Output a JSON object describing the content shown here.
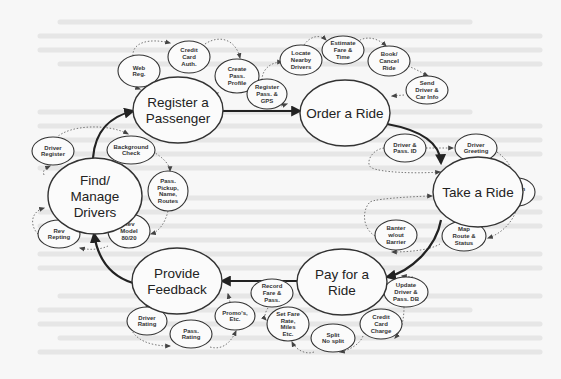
{
  "diagram": {
    "type": "cycle",
    "main_nodes": [
      {
        "id": "register",
        "label": [
          "Register a",
          "Passenger"
        ]
      },
      {
        "id": "order",
        "label": [
          "Order a Ride"
        ]
      },
      {
        "id": "take",
        "label": [
          "Take a Ride"
        ]
      },
      {
        "id": "pay",
        "label": [
          "Pay for a",
          "Ride"
        ]
      },
      {
        "id": "feedback",
        "label": [
          "Provide",
          "Feedback"
        ]
      },
      {
        "id": "drivers",
        "label": [
          "Find/",
          "Manage",
          "Drivers"
        ]
      }
    ],
    "main_flow": [
      "register",
      "order",
      "take",
      "pay",
      "feedback",
      "drivers",
      "register"
    ],
    "sub_nodes": {
      "register": [
        {
          "label": [
            "Web",
            "Reg."
          ]
        },
        {
          "label": [
            "Credit",
            "Card",
            "Auth."
          ]
        },
        {
          "label": [
            "Create",
            "Pass.",
            "Profile"
          ]
        }
      ],
      "order": [
        {
          "label": [
            "Register",
            "Pass. &",
            "GPS"
          ]
        },
        {
          "label": [
            "Locate",
            "Nearby",
            "Drivers"
          ]
        },
        {
          "label": [
            "Estimate",
            "Fare &",
            "Time"
          ]
        },
        {
          "label": [
            "Book/",
            "Cancel",
            "Ride"
          ]
        },
        {
          "label": [
            "Send",
            "Driver &",
            "Car Info"
          ]
        }
      ],
      "take": [
        {
          "label": [
            "Driver &",
            "Pass. ID"
          ]
        },
        {
          "label": [
            "Driver",
            "Greeting"
          ]
        },
        {
          "label": [
            "Clean",
            "Car"
          ]
        },
        {
          "label": [
            "Map",
            "Route &",
            "Status"
          ]
        },
        {
          "label": [
            "Banter",
            "w/out",
            "Barrier"
          ]
        }
      ],
      "pay": [
        {
          "label": [
            "Update",
            "Driver &",
            "Pass. DB"
          ]
        },
        {
          "label": [
            "Credit",
            "Card",
            "Charge"
          ]
        },
        {
          "label": [
            "Split",
            "No split"
          ]
        },
        {
          "label": [
            "Set Fare",
            "Rate,",
            "Miles",
            "Etc."
          ]
        },
        {
          "label": [
            "Record",
            "Fare &",
            "Pass."
          ]
        }
      ],
      "feedback": [
        {
          "label": [
            "Driver",
            "Rating"
          ]
        },
        {
          "label": [
            "Pass.",
            "Rating"
          ]
        },
        {
          "label": [
            "Promo's,",
            "Etc."
          ]
        }
      ],
      "drivers": [
        {
          "label": [
            "Driver",
            "Register"
          ]
        },
        {
          "label": [
            "Background",
            "Check"
          ]
        },
        {
          "label": [
            "Pass.",
            "Pickup,",
            "Name,",
            "Routes"
          ]
        },
        {
          "label": [
            "Rev",
            "Model",
            "80/20"
          ]
        },
        {
          "label": [
            "Rev",
            "Repting"
          ]
        }
      ]
    }
  }
}
